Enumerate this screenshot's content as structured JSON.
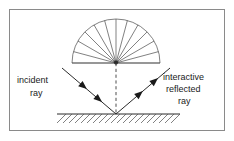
{
  "figure": {
    "border_color": "#8a8a8a",
    "background_color": "#ffffff",
    "line_color": "#3a3a3a",
    "text_color": "#1a1a1a",
    "width": 234,
    "height": 141
  },
  "labels": {
    "incident": {
      "line1": "incident",
      "line2": "ray"
    },
    "reflected": {
      "line1": "interactive",
      "line2": "reflected",
      "line3": "ray"
    }
  },
  "geometry": {
    "impact_point": {
      "x": 116,
      "y": 114
    },
    "fan_apex": {
      "x": 116,
      "y": 63
    },
    "fan_radius": 44,
    "fan_ray_count": 13,
    "fan_start_angle_deg": 180,
    "fan_end_angle_deg": 0,
    "ground_line": {
      "x1": 57,
      "y1": 114,
      "x2": 180,
      "y2": 114
    },
    "hatch_band": {
      "x": 57,
      "y": 114,
      "width": 123,
      "height": 10,
      "angle_deg": 45
    },
    "incident_ray": {
      "x1": 62,
      "y1": 68,
      "x2": 116,
      "y2": 114,
      "arrow_count": 2
    },
    "reflected_ray": {
      "x1": 116,
      "y1": 114,
      "x2": 170,
      "y2": 68,
      "arrow_count": 2
    },
    "normal_line": {
      "x1": 116,
      "y1": 63,
      "x2": 116,
      "y2": 114,
      "style": "dashed"
    }
  }
}
